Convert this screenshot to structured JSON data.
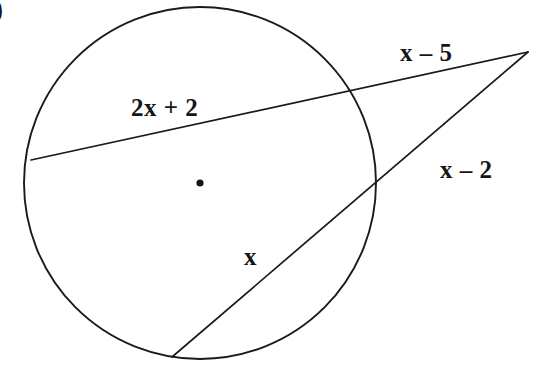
{
  "figure": {
    "problem_marker": ")",
    "background_color": "#ffffff",
    "stroke_color": "#1a1a1a",
    "text_color": "#151515"
  },
  "circle": {
    "center_x": 200,
    "center_y": 183,
    "radius": 176,
    "center_dot_radius": 3.6,
    "stroke_width": 1.9
  },
  "external_point": {
    "x": 528,
    "y": 52
  },
  "secant_upper": {
    "far_intersection_x": 31,
    "far_intersection_y": 160,
    "near_intersection_x": 349,
    "near_intersection_y": 94
  },
  "secant_lower": {
    "far_intersection_x": 172,
    "far_intersection_y": 357,
    "near_intersection_x": 375,
    "near_intersection_y": 178
  },
  "labels": {
    "chord_upper": "2x + 2",
    "external_upper": "x – 5",
    "external_lower": "x – 2",
    "chord_lower": "x"
  },
  "chart_data": {
    "type": "diagram",
    "shapes": [
      {
        "name": "circle",
        "kind": "circle",
        "center": [
          200,
          183
        ],
        "radius": 176
      },
      {
        "name": "center-dot",
        "kind": "point",
        "position": [
          200,
          183
        ]
      },
      {
        "name": "external-point",
        "kind": "point",
        "position": [
          528,
          52
        ]
      },
      {
        "name": "secant-upper",
        "kind": "line",
        "from": [
          31,
          160
        ],
        "to": [
          528,
          52
        ],
        "passes_through_circle_at": [
          [
            31,
            160
          ],
          [
            349,
            94
          ]
        ]
      },
      {
        "name": "secant-lower",
        "kind": "line",
        "from": [
          172,
          357
        ],
        "to": [
          528,
          52
        ],
        "passes_through_circle_at": [
          [
            172,
            357
          ],
          [
            375,
            178
          ]
        ]
      }
    ],
    "annotations": [
      {
        "name": "chord-upper-label",
        "text": "2x + 2",
        "segment": "chord of upper secant (inside circle)",
        "position": [
          131,
          95
        ]
      },
      {
        "name": "external-upper-label",
        "text": "x – 5",
        "segment": "external portion of upper secant",
        "position": [
          400,
          40
        ]
      },
      {
        "name": "external-lower-label",
        "text": "x – 2",
        "segment": "external portion of lower secant",
        "position": [
          440,
          157
        ]
      },
      {
        "name": "chord-lower-label",
        "text": "x",
        "segment": "chord of lower secant (inside circle)",
        "position": [
          244,
          244
        ]
      }
    ]
  }
}
